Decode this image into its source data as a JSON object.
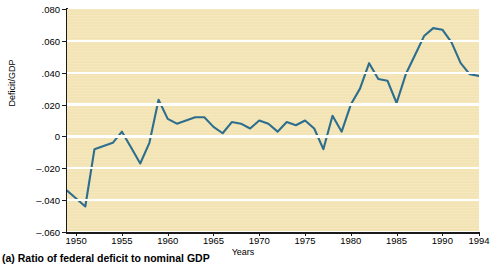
{
  "figure": {
    "caption": "(a) Ratio of federal deficit to nominal GDP",
    "plot_background_color": "#f5e6b8",
    "line_color": "#2d6e8e",
    "gridline_color": "#ffffff"
  },
  "chart_data": {
    "type": "line",
    "title": "",
    "subtitle": "",
    "xlabel": "Years",
    "ylabel": "Deficit/GDP",
    "xlim": [
      1949,
      1994
    ],
    "ylim": [
      -0.06,
      0.08
    ],
    "grid": true,
    "legend": null,
    "legend_position": "none",
    "y_ticks": [
      0.08,
      0.06,
      0.04,
      0.02,
      0,
      -0.02,
      -0.04,
      -0.06
    ],
    "y_tick_labels": [
      ".080",
      ".060",
      ".040",
      ".020",
      "0",
      "–.020",
      "–.040",
      "–.060"
    ],
    "x_ticks": [
      1950,
      1955,
      1960,
      1965,
      1970,
      1975,
      1980,
      1985,
      1990,
      1994
    ],
    "x_tick_labels": [
      "1950",
      "1955",
      "1960",
      "1965",
      "1970",
      "1975",
      "1980",
      "1985",
      "1990",
      "1994"
    ],
    "series": [
      {
        "name": "Deficit/GDP",
        "color": "#2d6e8e",
        "x": [
          1949,
          1950,
          1951,
          1952,
          1953,
          1954,
          1955,
          1956,
          1957,
          1958,
          1959,
          1960,
          1961,
          1962,
          1963,
          1964,
          1965,
          1966,
          1967,
          1968,
          1969,
          1970,
          1971,
          1972,
          1973,
          1974,
          1975,
          1976,
          1977,
          1978,
          1979,
          1980,
          1981,
          1982,
          1983,
          1984,
          1985,
          1986,
          1987,
          1988,
          1989,
          1990,
          1991,
          1992,
          1993,
          1994
        ],
        "values": [
          -0.034,
          -0.039,
          -0.044,
          -0.008,
          -0.006,
          -0.004,
          0.003,
          -0.007,
          -0.017,
          -0.004,
          0.023,
          0.011,
          0.008,
          0.01,
          0.012,
          0.012,
          0.006,
          0.002,
          0.009,
          0.008,
          0.005,
          0.01,
          0.008,
          0.003,
          0.009,
          0.007,
          0.01,
          0.005,
          -0.008,
          0.013,
          0.003,
          0.02,
          0.03,
          0.046,
          0.036,
          0.035,
          0.021,
          0.039,
          0.051,
          0.063,
          0.068,
          0.067,
          0.059,
          0.046,
          0.039,
          0.038
        ]
      }
    ]
  },
  "axis": {
    "y_title": "Deficit/GDP",
    "x_title": "Years"
  }
}
